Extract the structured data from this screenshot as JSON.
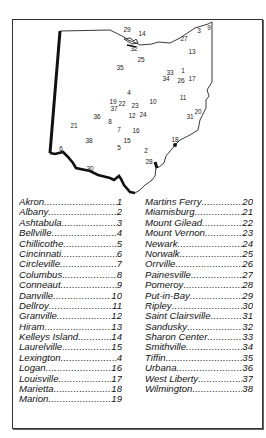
{
  "map": {
    "title": "Ohio",
    "markers": [
      {
        "n": "29",
        "x": 127,
        "y": 32
      },
      {
        "n": "14",
        "x": 142,
        "y": 36
      },
      {
        "n": "3",
        "x": 199,
        "y": 33
      },
      {
        "n": "9",
        "x": 209,
        "y": 30
      },
      {
        "n": "27",
        "x": 184,
        "y": 41
      },
      {
        "n": "32",
        "x": 134,
        "y": 51
      },
      {
        "n": "13",
        "x": 192,
        "y": 54
      },
      {
        "n": "25",
        "x": 141,
        "y": 62
      },
      {
        "n": "35",
        "x": 120,
        "y": 70
      },
      {
        "n": "33",
        "x": 170,
        "y": 75
      },
      {
        "n": "1",
        "x": 183,
        "y": 73
      },
      {
        "n": "34",
        "x": 166,
        "y": 81
      },
      {
        "n": "26",
        "x": 181,
        "y": 83
      },
      {
        "n": "17",
        "x": 192,
        "y": 81
      },
      {
        "n": "4",
        "x": 129,
        "y": 95
      },
      {
        "n": "10",
        "x": 153,
        "y": 104
      },
      {
        "n": "11",
        "x": 183,
        "y": 100
      },
      {
        "n": "19",
        "x": 113,
        "y": 104
      },
      {
        "n": "22",
        "x": 122,
        "y": 106
      },
      {
        "n": "23",
        "x": 135,
        "y": 108
      },
      {
        "n": "37",
        "x": 114,
        "y": 111
      },
      {
        "n": "12",
        "x": 132,
        "y": 118
      },
      {
        "n": "24",
        "x": 143,
        "y": 117
      },
      {
        "n": "20",
        "x": 198,
        "y": 114
      },
      {
        "n": "31",
        "x": 190,
        "y": 119
      },
      {
        "n": "36",
        "x": 97,
        "y": 119
      },
      {
        "n": "8",
        "x": 110,
        "y": 124
      },
      {
        "n": "21",
        "x": 74,
        "y": 128
      },
      {
        "n": "7",
        "x": 119,
        "y": 132
      },
      {
        "n": "16",
        "x": 136,
        "y": 133
      },
      {
        "n": "38",
        "x": 89,
        "y": 143
      },
      {
        "n": "15",
        "x": 127,
        "y": 143
      },
      {
        "n": "18",
        "x": 175,
        "y": 142
      },
      {
        "n": "5",
        "x": 119,
        "y": 150
      },
      {
        "n": "2",
        "x": 146,
        "y": 153
      },
      {
        "n": "6",
        "x": 61,
        "y": 151
      },
      {
        "n": "28",
        "x": 149,
        "y": 164
      },
      {
        "n": "30",
        "x": 90,
        "y": 171
      }
    ]
  },
  "legend": {
    "left": [
      {
        "name": "Akron",
        "num": "1"
      },
      {
        "name": "Albany",
        "num": "2"
      },
      {
        "name": "Ashtabula",
        "num": "3"
      },
      {
        "name": "Bellville",
        "num": "4"
      },
      {
        "name": "Chillicothe",
        "num": "5"
      },
      {
        "name": "Cincinnati",
        "num": "6"
      },
      {
        "name": "Circleville",
        "num": "7"
      },
      {
        "name": "Columbus",
        "num": "8"
      },
      {
        "name": "Conneaut",
        "num": "9"
      },
      {
        "name": "Danville",
        "num": "10"
      },
      {
        "name": "Dellroy",
        "num": "11"
      },
      {
        "name": "Granville",
        "num": "12"
      },
      {
        "name": "Hiram",
        "num": "13"
      },
      {
        "name": "Kelleys Island",
        "num": "14"
      },
      {
        "name": "Laurelville",
        "num": "15"
      },
      {
        "name": "Lexington",
        "num": "4"
      },
      {
        "name": "Logan",
        "num": "16"
      },
      {
        "name": "Louisville",
        "num": "17"
      },
      {
        "name": "Marietta",
        "num": "18"
      },
      {
        "name": "Marion",
        "num": "19"
      }
    ],
    "right": [
      {
        "name": "Martins Ferry",
        "num": "20"
      },
      {
        "name": "Miamisburg",
        "num": "21"
      },
      {
        "name": "Mount Gilead",
        "num": "22"
      },
      {
        "name": "Mount Vernon",
        "num": "23"
      },
      {
        "name": "Newark",
        "num": "24"
      },
      {
        "name": "Norwalk",
        "num": "25"
      },
      {
        "name": "Orrville",
        "num": "26"
      },
      {
        "name": "Painesville",
        "num": "27"
      },
      {
        "name": "Pomeroy",
        "num": "28"
      },
      {
        "name": "Put-in-Bay",
        "num": "29"
      },
      {
        "name": "Ripley",
        "num": "30"
      },
      {
        "name": "Saint Clairsville",
        "num": "31"
      },
      {
        "name": "Sandusky",
        "num": "32"
      },
      {
        "name": "Sharon Center",
        "num": "33"
      },
      {
        "name": "Smithville",
        "num": "34"
      },
      {
        "name": "Tiffin",
        "num": "35"
      },
      {
        "name": "Urbana",
        "num": "36"
      },
      {
        "name": "West Liberty",
        "num": "37"
      },
      {
        "name": "Wilmington",
        "num": "38"
      }
    ]
  }
}
